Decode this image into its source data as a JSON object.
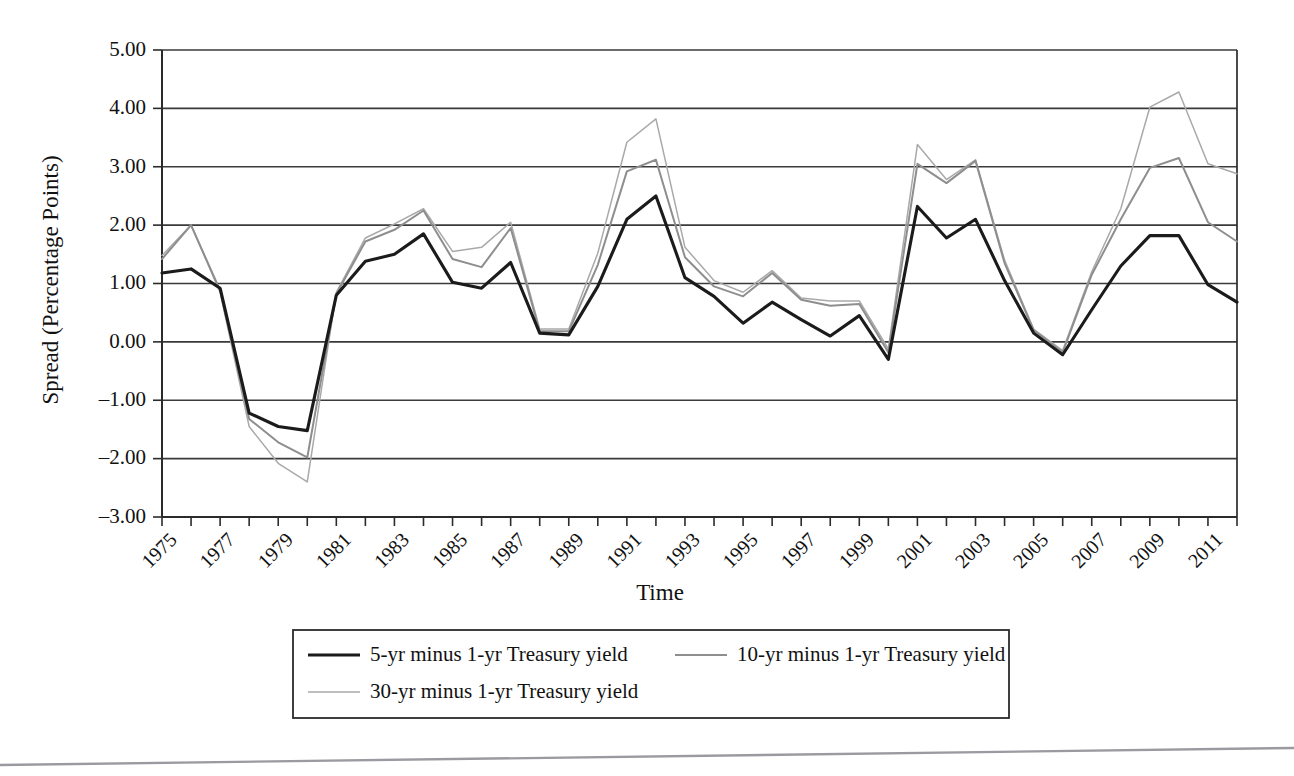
{
  "figure": {
    "background_color": "#ffffff",
    "axis_color": "#2b2b2b"
  },
  "axes": {
    "y_title": "Spread (Percentage Points)",
    "x_title": "Time",
    "y_ticks": [
      "5.00",
      "4.00",
      "3.00",
      "2.00",
      "1.00",
      "0.00",
      "-1.00",
      "-2.00",
      "-3.00"
    ],
    "x_ticks": [
      "1975",
      "1977",
      "1979",
      "1981",
      "1983",
      "1985",
      "1987",
      "1989",
      "1991",
      "1993",
      "1995",
      "1997",
      "1999",
      "2001",
      "2003",
      "2005",
      "2007",
      "2009",
      "2011"
    ]
  },
  "legend": {
    "items": [
      {
        "label": "5-yr minus 1-yr Treasury yield",
        "color": "#1b1b1b",
        "width": 3.1
      },
      {
        "label": "10-yr minus 1-yr Treasury yield",
        "color": "#8e8e8e",
        "width": 2.0
      },
      {
        "label": "30-yr minus 1-yr Treasury yield",
        "color": "#a9a9a9",
        "width": 1.5
      }
    ]
  },
  "chart_data": {
    "type": "line",
    "title": "",
    "subtitle": "",
    "xlabel": "Time",
    "ylabel": "Spread (Percentage Points)",
    "xlim": [
      1975,
      2012
    ],
    "ylim": [
      -3.0,
      5.0
    ],
    "ytick_values": [
      5.0,
      4.0,
      3.0,
      2.0,
      1.0,
      0.0,
      -1.0,
      -2.0,
      -3.0
    ],
    "xtick_values": [
      1975,
      1977,
      1979,
      1981,
      1983,
      1985,
      1987,
      1989,
      1991,
      1993,
      1995,
      1997,
      1999,
      2001,
      2003,
      2005,
      2007,
      2009,
      2011
    ],
    "grid": "horizontal",
    "legend_position": "below-plot",
    "x": [
      1975,
      1976,
      1977,
      1978,
      1979,
      1980,
      1981,
      1982,
      1983,
      1984,
      1985,
      1986,
      1987,
      1988,
      1989,
      1990,
      1991,
      1992,
      1993,
      1994,
      1995,
      1996,
      1997,
      1998,
      1999,
      2000,
      2001,
      2002,
      2003,
      2004,
      2005,
      2006,
      2007,
      2008,
      2009,
      2010,
      2011,
      2012
    ],
    "series": [
      {
        "name": "5-yr minus 1-yr Treasury yield",
        "color": "#1b1b1b",
        "values": [
          1.18,
          1.25,
          0.92,
          -1.22,
          -1.45,
          -1.52,
          0.8,
          1.38,
          1.5,
          1.85,
          1.02,
          0.92,
          1.36,
          0.15,
          0.12,
          0.95,
          2.1,
          2.5,
          1.1,
          0.78,
          0.32,
          0.68,
          0.38,
          0.1,
          0.45,
          -0.3,
          2.32,
          1.78,
          2.1,
          1.05,
          0.15,
          -0.22,
          0.55,
          1.3,
          1.82,
          1.82,
          0.98,
          0.68
        ]
      },
      {
        "name": "10-yr minus 1-yr Treasury yield",
        "color": "#8e8e8e",
        "values": [
          1.42,
          2.0,
          0.88,
          -1.32,
          -1.72,
          -1.98,
          0.82,
          1.72,
          1.92,
          2.25,
          1.42,
          1.28,
          1.95,
          0.18,
          0.18,
          1.32,
          2.92,
          3.12,
          1.45,
          0.95,
          0.78,
          1.18,
          0.72,
          0.62,
          0.65,
          -0.18,
          3.05,
          2.72,
          3.1,
          1.35,
          0.2,
          -0.18,
          1.15,
          2.1,
          2.98,
          3.15,
          2.05,
          1.72
        ]
      },
      {
        "name": "30-yr minus 1-yr Treasury yield",
        "color": "#a9a9a9",
        "values": [
          1.48,
          2.0,
          0.85,
          -1.45,
          -2.08,
          -2.4,
          0.85,
          1.78,
          2.02,
          2.28,
          1.55,
          1.62,
          2.05,
          0.22,
          0.22,
          1.52,
          3.42,
          3.82,
          1.62,
          1.05,
          0.85,
          1.22,
          0.75,
          0.7,
          0.7,
          -0.12,
          3.38,
          2.78,
          3.12,
          1.4,
          0.22,
          -0.15,
          1.2,
          2.28,
          4.02,
          4.28,
          3.05,
          2.88
        ]
      }
    ]
  }
}
